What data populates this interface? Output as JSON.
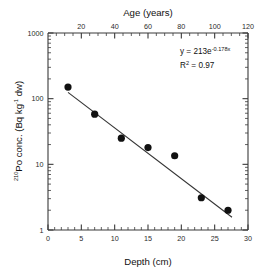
{
  "chart_data": {
    "type": "scatter",
    "title": "",
    "xlabel": "Depth (cm)",
    "ylabel": "210Po conc. (Bq kg-1 dw)",
    "ylabel_parts": {
      "isotope_sup": "210",
      "main": "Po conc. (Bq kg",
      "exp_sup": "-1",
      "tail": " dw)"
    },
    "secondary_xlabel": "Age (years)",
    "yscale": "log",
    "ylim": [
      1,
      1000
    ],
    "xlim": [
      0,
      30
    ],
    "secondary_xlim": [
      0,
      120
    ],
    "grid": false,
    "legend": false,
    "y_ticks": [
      "1",
      "10",
      "100",
      "1000"
    ],
    "y_tick_values": [
      1,
      10,
      100,
      1000
    ],
    "x_ticks": [
      "0",
      "5",
      "10",
      "15",
      "20",
      "25",
      "30"
    ],
    "x_tick_values": [
      0,
      5,
      10,
      15,
      20,
      25,
      30
    ],
    "secondary_x_ticks": [
      "20",
      "40",
      "60",
      "80",
      "100",
      "120"
    ],
    "secondary_x_tick_values": [
      20,
      40,
      60,
      80,
      100,
      120
    ],
    "x": [
      3,
      7,
      11,
      15,
      19,
      23,
      27
    ],
    "values": [
      150,
      58,
      25,
      18,
      13.5,
      3.1,
      2.0
    ],
    "point_color": "#111111",
    "line_color": "#333333",
    "fit": {
      "type": "exponential",
      "amplitude": 213,
      "rate": -0.178,
      "equation_prefix": "y = 213e",
      "equation_exponent": "-0.178x",
      "r_squared_label": "R",
      "r_squared_sup": "2",
      "r_squared_value": " = 0.97",
      "line_x_start": 3,
      "line_x_end": 27.6
    }
  },
  "annotations": {
    "equation_prefix": "y = 213e",
    "equation_exponent": "-0.178x",
    "r_label": "R",
    "r_sup": "2",
    "r_value": " = 0.97"
  }
}
